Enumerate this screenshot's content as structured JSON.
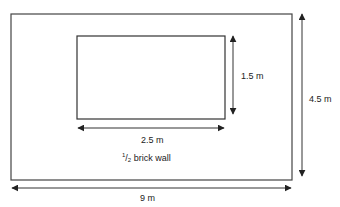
{
  "diagram": {
    "outer": {
      "width_label": "9 m",
      "height_label": "4.5 m"
    },
    "opening": {
      "width_label": "2.5 m",
      "height_label": "1.5 m"
    },
    "wall_label": {
      "numerator": "1",
      "denominator": "2",
      "text": " brick wall"
    },
    "colors": {
      "line": "#333333",
      "background": "#ffffff"
    }
  }
}
